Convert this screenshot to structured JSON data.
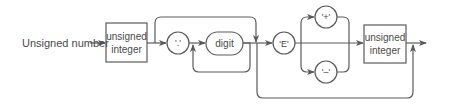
{
  "diagram": {
    "type": "syntax-diagram",
    "title": "Unsigned number",
    "colors": {
      "line": "#5a5a5a",
      "text": "#4a4a4a",
      "background": "#ffffff"
    },
    "nodes": [
      {
        "id": "unsigned-integer-1",
        "kind": "nonterminal",
        "line1": "unsigned",
        "line2": "integer"
      },
      {
        "id": "dot",
        "kind": "terminal",
        "label": "'.'"
      },
      {
        "id": "digit",
        "kind": "terminal-rounded",
        "label": "digit"
      },
      {
        "id": "E",
        "kind": "terminal",
        "label": "'E'"
      },
      {
        "id": "plus",
        "kind": "terminal",
        "label": "'+'"
      },
      {
        "id": "minus",
        "kind": "terminal",
        "label": "'–'"
      },
      {
        "id": "unsigned-integer-2",
        "kind": "nonterminal",
        "line1": "unsigned",
        "line2": "integer"
      }
    ],
    "edges": [
      {
        "from": "start",
        "to": "unsigned-integer-1"
      },
      {
        "from": "unsigned-integer-1",
        "to": "dot"
      },
      {
        "from": "unsigned-integer-1",
        "to": "E",
        "note": "bypass fraction (top loop)"
      },
      {
        "from": "dot",
        "to": "digit"
      },
      {
        "from": "digit",
        "to": "digit",
        "note": "repeat loop"
      },
      {
        "from": "digit",
        "to": "E"
      },
      {
        "from": "digit",
        "to": "end",
        "note": "bypass exponent (bottom loop)"
      },
      {
        "from": "E",
        "to": "plus"
      },
      {
        "from": "E",
        "to": "minus"
      },
      {
        "from": "E",
        "to": "unsigned-integer-2"
      },
      {
        "from": "plus",
        "to": "unsigned-integer-2"
      },
      {
        "from": "minus",
        "to": "unsigned-integer-2"
      },
      {
        "from": "unsigned-integer-2",
        "to": "end"
      }
    ]
  }
}
